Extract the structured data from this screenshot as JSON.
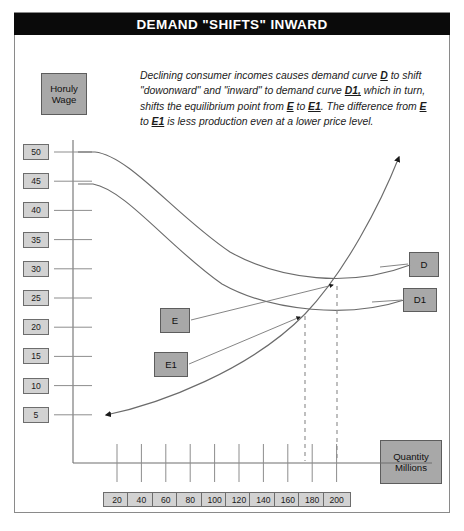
{
  "title": "DEMAND \"SHIFTS\" INWARD",
  "description": {
    "segments": [
      {
        "text": "Declining consumer incomes causes demand curve ",
        "bold": false
      },
      {
        "text": "D",
        "bold": true
      },
      {
        "text": " to shift \"dowonward\" and \"inward\" to demand curve ",
        "bold": false
      },
      {
        "text": "D1,",
        "bold": true
      },
      {
        "text": " which in turn, shifts the equilibrium point from ",
        "bold": false
      },
      {
        "text": "E",
        "bold": true
      },
      {
        "text": " to ",
        "bold": false
      },
      {
        "text": "E1",
        "bold": true
      },
      {
        "text": ". The difference from ",
        "bold": false
      },
      {
        "text": "E",
        "bold": true
      },
      {
        "text": " to ",
        "bold": false
      },
      {
        "text": "E1",
        "bold": true
      },
      {
        "text": " is less production even at a lower price level.",
        "bold": false
      }
    ],
    "plain": "Declining consumer incomes causes demand curve D to shift \"dowonward\" and \"inward\" to demand curve D1, which in turn, shifts the equilibrium point from E to E1. The difference from E to E1 is less production even at a lower price level."
  },
  "axes": {
    "y_title_line1": "Horuly",
    "y_title_line2": "Wage",
    "x_title_line1": "Quantity",
    "x_title_line2": "Millions",
    "y_ticks": [
      "50",
      "45",
      "40",
      "35",
      "30",
      "25",
      "20",
      "15",
      "10",
      "5"
    ],
    "x_ticks": [
      "20",
      "40",
      "60",
      "80",
      "100",
      "120",
      "140",
      "160",
      "180",
      "200"
    ]
  },
  "labels": {
    "demand": "D",
    "demand_shifted": "D1",
    "equilibrium": "E",
    "equilibrium_shifted": "E1"
  },
  "colors": {
    "banner_bg": "#0a0a0a",
    "banner_text": "#ffffff",
    "label_box_bg": "#a8a8a8",
    "tick_box_bg": "#d2d2d2",
    "curve_stroke": "#6b6b6b",
    "frame_stroke": "#8a8a8a"
  },
  "chart_data": {
    "type": "line",
    "title": "DEMAND \"SHIFTS\" INWARD",
    "xlabel": "Quantity Millions",
    "ylabel": "Horuly Wage",
    "xlim": [
      0,
      210
    ],
    "ylim": [
      0,
      52
    ],
    "grid": false,
    "legend": "inline-callouts",
    "series": [
      {
        "name": "D",
        "role": "demand-original",
        "points": [
          [
            12,
            50
          ],
          [
            30,
            45
          ],
          [
            55,
            37
          ],
          [
            85,
            30
          ],
          [
            120,
            26
          ],
          [
            160,
            24
          ],
          [
            200,
            23
          ]
        ]
      },
      {
        "name": "D1",
        "role": "demand-shifted",
        "points": [
          [
            12,
            45
          ],
          [
            30,
            40
          ],
          [
            55,
            32
          ],
          [
            85,
            25
          ],
          [
            120,
            21
          ],
          [
            160,
            19
          ],
          [
            200,
            18
          ]
        ]
      },
      {
        "name": "S",
        "role": "supply",
        "points": [
          [
            18,
            5
          ],
          [
            60,
            9
          ],
          [
            100,
            15
          ],
          [
            140,
            24
          ],
          [
            170,
            34
          ],
          [
            188,
            46
          ]
        ]
      }
    ],
    "equilibria": [
      {
        "name": "E",
        "x": 180,
        "y": 24,
        "curve": "D"
      },
      {
        "name": "E1",
        "x": 160,
        "y": 20,
        "curve": "D1"
      }
    ],
    "annotations": [
      {
        "label": "D",
        "target": "demand-original-right-end"
      },
      {
        "label": "D1",
        "target": "demand-shifted-right-end"
      },
      {
        "label": "E",
        "target": "equilibrium-E"
      },
      {
        "label": "E1",
        "target": "equilibrium-E1"
      }
    ]
  }
}
